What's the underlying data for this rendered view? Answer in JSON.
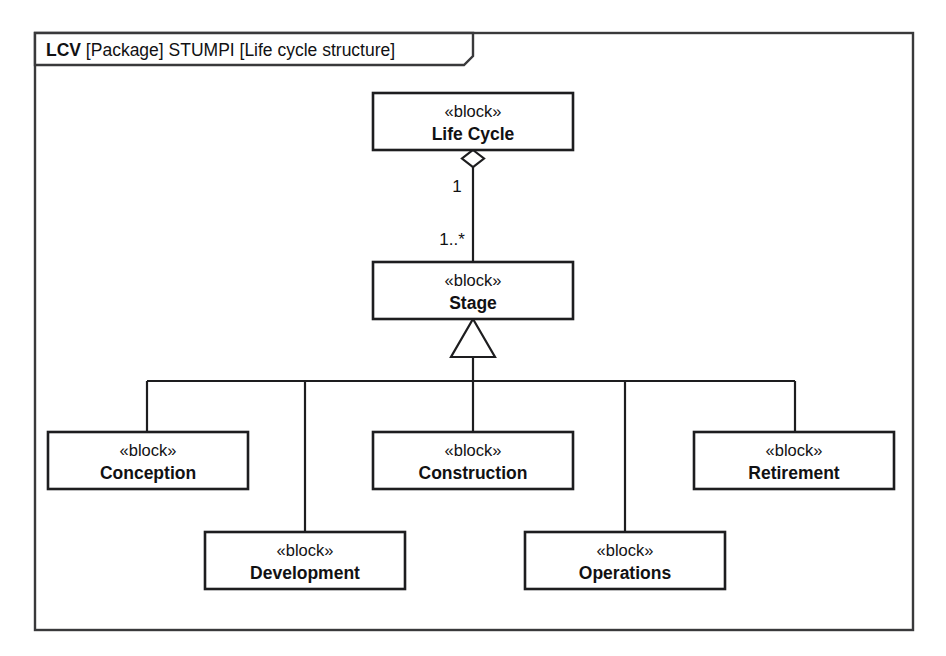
{
  "diagram": {
    "kind": "sysml-block-definition-diagram",
    "frame": {
      "tab_label_bold": "LCV",
      "tab_label_rest": " [Package] STUMPI [Life cycle structure]",
      "tab_full": "LCV [Package] STUMPI [Life cycle structure]"
    },
    "stereotype": "«block»",
    "colors": {
      "background": "#ffffff",
      "frame_stroke": "#39393b",
      "block_stroke": "#1d1d1f",
      "connector_stroke": "#1d1d1f",
      "text": "#111113"
    },
    "blocks": [
      {
        "id": "life-cycle",
        "stereotype": "«block»",
        "name": "Life Cycle",
        "x": 373,
        "y": 93,
        "w": 200,
        "h": 57
      },
      {
        "id": "stage",
        "stereotype": "«block»",
        "name": "Stage",
        "x": 373,
        "y": 262,
        "w": 200,
        "h": 57
      },
      {
        "id": "conception",
        "stereotype": "«block»",
        "name": "Conception",
        "x": 48,
        "y": 432,
        "w": 200,
        "h": 57
      },
      {
        "id": "construction",
        "stereotype": "«block»",
        "name": "Construction",
        "x": 373,
        "y": 432,
        "w": 200,
        "h": 57
      },
      {
        "id": "retirement",
        "stereotype": "«block»",
        "name": "Retirement",
        "x": 694,
        "y": 432,
        "w": 200,
        "h": 57
      },
      {
        "id": "development",
        "stereotype": "«block»",
        "name": "Development",
        "x": 205,
        "y": 532,
        "w": 200,
        "h": 57
      },
      {
        "id": "operations",
        "stereotype": "«block»",
        "name": "Operations",
        "x": 525,
        "y": 532,
        "w": 200,
        "h": 57
      }
    ],
    "relationships": [
      {
        "id": "lifecycle-stage-aggregation",
        "type": "aggregation",
        "source": "life-cycle",
        "target": "stage",
        "source_multiplicity": "1",
        "target_multiplicity": "1..*",
        "diamond": "hollow"
      },
      {
        "id": "stage-conception-generalization",
        "type": "generalization",
        "source": "conception",
        "target": "stage"
      },
      {
        "id": "stage-development-generalization",
        "type": "generalization",
        "source": "development",
        "target": "stage"
      },
      {
        "id": "stage-construction-generalization",
        "type": "generalization",
        "source": "construction",
        "target": "stage"
      },
      {
        "id": "stage-operations-generalization",
        "type": "generalization",
        "source": "operations",
        "target": "stage"
      },
      {
        "id": "stage-retirement-generalization",
        "type": "generalization",
        "source": "retirement",
        "target": "stage"
      }
    ]
  }
}
